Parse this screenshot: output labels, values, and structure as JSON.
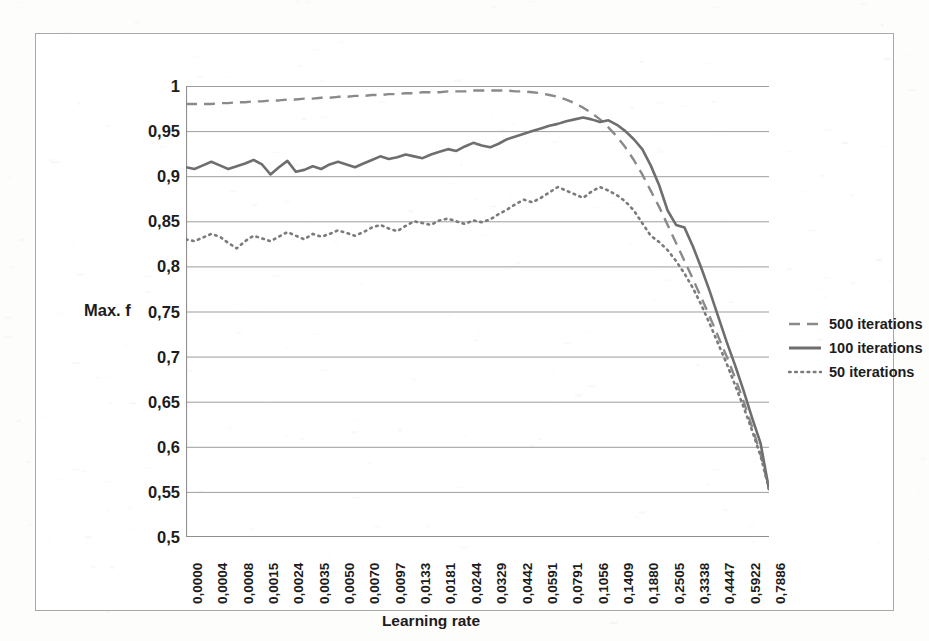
{
  "chart_data": {
    "type": "line",
    "title": "",
    "xlabel": "Learning rate",
    "ylabel": "Max. f",
    "ylim": [
      0.5,
      1.0
    ],
    "ytick_labels": [
      "1",
      "0,95",
      "0,9",
      "0,85",
      "0,8",
      "0,75",
      "0,7",
      "0,65",
      "0,6",
      "0,55",
      "0,5"
    ],
    "ytick_values": [
      1.0,
      0.95,
      0.9,
      0.85,
      0.8,
      0.75,
      0.7,
      0.65,
      0.6,
      0.55,
      0.5
    ],
    "grid": "horizontal",
    "legend_position": "right",
    "x_tick_labels": [
      "0,0000",
      "0,0004",
      "0,0008",
      "0,0015",
      "0,0024",
      "0,0035",
      "0,0050",
      "0,0070",
      "0,0097",
      "0,0133",
      "0,0181",
      "0,0244",
      "0,0329",
      "0,0442",
      "0,0591",
      "0,0791",
      "0,1056",
      "0,1409",
      "0,1880",
      "0,2505",
      "0,3338",
      "0,4447",
      "0,5922",
      "0,7886"
    ],
    "x_label_every_n_ticks": 3,
    "n_points": 70,
    "series": [
      {
        "name": "500 iterations",
        "style": "dashed",
        "color": "#8a8a8a",
        "values": [
          0.98,
          0.98,
          0.98,
          0.98,
          0.981,
          0.981,
          0.982,
          0.982,
          0.983,
          0.983,
          0.984,
          0.984,
          0.985,
          0.985,
          0.986,
          0.986,
          0.987,
          0.987,
          0.988,
          0.988,
          0.989,
          0.989,
          0.99,
          0.99,
          0.991,
          0.991,
          0.992,
          0.992,
          0.993,
          0.993,
          0.993,
          0.994,
          0.994,
          0.994,
          0.995,
          0.995,
          0.995,
          0.995,
          0.995,
          0.994,
          0.994,
          0.993,
          0.992,
          0.99,
          0.988,
          0.985,
          0.981,
          0.976,
          0.97,
          0.963,
          0.954,
          0.944,
          0.932,
          0.918,
          0.902,
          0.884,
          0.866,
          0.846,
          0.826,
          0.806,
          0.786,
          0.765,
          0.744,
          0.722,
          0.7,
          0.676,
          0.65,
          0.622,
          0.592,
          0.553
        ]
      },
      {
        "name": "100 iterations",
        "style": "solid",
        "color": "#6e6e6e",
        "values": [
          0.91,
          0.908,
          0.912,
          0.916,
          0.912,
          0.908,
          0.911,
          0.914,
          0.918,
          0.913,
          0.902,
          0.91,
          0.917,
          0.905,
          0.907,
          0.911,
          0.908,
          0.913,
          0.916,
          0.913,
          0.91,
          0.914,
          0.918,
          0.922,
          0.919,
          0.921,
          0.924,
          0.922,
          0.92,
          0.924,
          0.927,
          0.93,
          0.928,
          0.933,
          0.937,
          0.934,
          0.932,
          0.936,
          0.941,
          0.944,
          0.947,
          0.95,
          0.953,
          0.956,
          0.958,
          0.961,
          0.963,
          0.965,
          0.963,
          0.96,
          0.962,
          0.957,
          0.95,
          0.941,
          0.93,
          0.912,
          0.89,
          0.862,
          0.846,
          0.843,
          0.822,
          0.798,
          0.772,
          0.744,
          0.716,
          0.69,
          0.662,
          0.632,
          0.604,
          0.553
        ]
      },
      {
        "name": "50 iterations",
        "style": "dotted",
        "color": "#7b7b7b",
        "values": [
          0.83,
          0.828,
          0.832,
          0.836,
          0.833,
          0.826,
          0.82,
          0.828,
          0.834,
          0.831,
          0.828,
          0.833,
          0.838,
          0.834,
          0.83,
          0.836,
          0.833,
          0.836,
          0.84,
          0.837,
          0.834,
          0.838,
          0.843,
          0.846,
          0.842,
          0.839,
          0.845,
          0.85,
          0.848,
          0.846,
          0.851,
          0.853,
          0.85,
          0.847,
          0.851,
          0.849,
          0.852,
          0.858,
          0.863,
          0.869,
          0.874,
          0.871,
          0.876,
          0.882,
          0.888,
          0.884,
          0.88,
          0.876,
          0.883,
          0.888,
          0.884,
          0.879,
          0.872,
          0.862,
          0.848,
          0.834,
          0.827,
          0.818,
          0.806,
          0.792,
          0.776,
          0.757,
          0.736,
          0.714,
          0.692,
          0.668,
          0.644,
          0.618,
          0.59,
          0.553
        ]
      }
    ]
  },
  "axis": {
    "y_title": "Max. f",
    "x_title": "Learning rate"
  },
  "legend": {
    "items": [
      {
        "label": "500 iterations",
        "style": "dashed"
      },
      {
        "label": "100 iterations",
        "style": "solid"
      },
      {
        "label": "50 iterations",
        "style": "dotted"
      }
    ]
  },
  "colors": {
    "frame": "#a9a9a9",
    "gridline": "#9d9d9d",
    "axis": "#8f8f8f",
    "text": "#1c1c1c",
    "background": "#ffffff"
  }
}
